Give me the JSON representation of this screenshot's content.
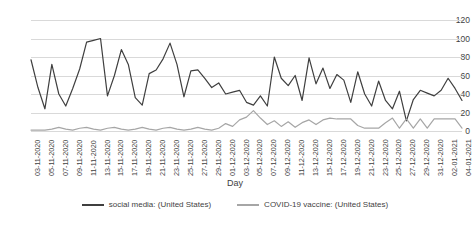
{
  "chart_data": {
    "type": "line",
    "title": "",
    "xlabel": "Day",
    "ylabel": "",
    "ylim": [
      0,
      120
    ],
    "yticks": [
      0,
      20,
      40,
      60,
      80,
      100,
      120
    ],
    "grid": true,
    "legend_position": "bottom",
    "x": [
      "03-11-2020",
      "04-11-2020",
      "05-11-2020",
      "06-11-2020",
      "07-11-2020",
      "08-11-2020",
      "09-11-2020",
      "10-11-2020",
      "11-11-2020",
      "12-11-2020",
      "13-11-2020",
      "14-11-2020",
      "15-11-2020",
      "16-11-2020",
      "17-11-2020",
      "18-11-2020",
      "19-11-2020",
      "20-11-2020",
      "21-11-2020",
      "22-11-2020",
      "23-11-2020",
      "24-11-2020",
      "25-11-2020",
      "26-11-2020",
      "27-11-2020",
      "28-11-2020",
      "29-11-2020",
      "30-11-2020",
      "01-12-2020",
      "02-12-2020",
      "03-12-2020",
      "04-12-2020",
      "05-12-2020",
      "06-12-2020",
      "07-12-2020",
      "08-12-2020",
      "09-12-2020",
      "10-12-2020",
      "11-12-2020",
      "12-12-2020",
      "13-12-2020",
      "14-12-2020",
      "15-12-2020",
      "16-12-2020",
      "17-12-2020",
      "18-12-2020",
      "19-12-2020",
      "20-12-2020",
      "21-12-2020",
      "22-12-2020",
      "23-12-2020",
      "24-12-2020",
      "25-12-2020",
      "26-12-2020",
      "27-12-2020",
      "28-12-2020",
      "29-12-2020",
      "30-12-2020",
      "31-12-2020",
      "01-01-2021",
      "02-01-2021",
      "03-01-2021",
      "04-01-2021"
    ],
    "xtick_labels": [
      "03-11-2020",
      "05-11-2020",
      "07-11-2020",
      "09-11-2020",
      "11-11-2020",
      "13-11-2020",
      "15-11-2020",
      "17-11-2020",
      "19-11-2020",
      "21-11-2020",
      "23-11-2020",
      "25-11-2020",
      "27-11-2020",
      "29-11-2020",
      "01-12-2020",
      "03-12-2020",
      "05-12-2020",
      "07-12-2020",
      "09-12-2020",
      "11-12-2020",
      "13-12-2020",
      "15-12-2020",
      "17-12-2020",
      "19-12-2020",
      "21-12-2020",
      "23-12-2020",
      "25-12-2020",
      "27-12-2020",
      "29-12-2020",
      "31-12-2020",
      "02-01-2021",
      "04-01-2021"
    ],
    "series": [
      {
        "name": "social media: (United States)",
        "color": "#3f3f3f",
        "values": [
          77,
          47,
          24,
          72,
          40,
          27,
          46,
          67,
          96,
          98,
          100,
          38,
          60,
          88,
          72,
          36,
          28,
          62,
          66,
          78,
          95,
          72,
          37,
          65,
          66,
          57,
          47,
          52,
          40,
          42,
          44,
          31,
          28,
          38,
          27,
          80,
          57,
          49,
          60,
          33,
          79,
          51,
          68,
          46,
          61,
          55,
          31,
          64,
          40,
          27,
          54,
          33,
          24,
          43,
          11,
          34,
          44,
          41,
          38,
          44,
          57,
          46,
          33
        ]
      },
      {
        "name": "COVID-19 vaccine: (United States)",
        "color": "#a6a6a6",
        "values": [
          1,
          1,
          1,
          2,
          4,
          2,
          1,
          3,
          4,
          2,
          1,
          3,
          4,
          2,
          1,
          2,
          4,
          2,
          1,
          3,
          4,
          2,
          1,
          2,
          4,
          2,
          1,
          3,
          8,
          5,
          12,
          15,
          22,
          14,
          7,
          11,
          5,
          10,
          4,
          9,
          12,
          7,
          12,
          14,
          13,
          13,
          13,
          6,
          3,
          3,
          3,
          9,
          14,
          3,
          13,
          3,
          13,
          3,
          13,
          13,
          13,
          13,
          3
        ]
      }
    ]
  }
}
